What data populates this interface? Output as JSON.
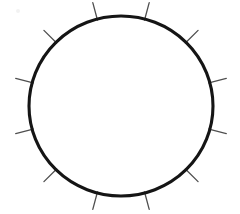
{
  "figure": {
    "background_color": "#ffffff",
    "width": 240,
    "height": 214
  },
  "circle": {
    "name": "main-circle",
    "center_x": 121,
    "center_y": 106,
    "radius_x": 92,
    "radius_y": 90,
    "stroke_color": "#151515",
    "stroke_width": 3.1,
    "fill": "none"
  },
  "ticks": {
    "count": 12,
    "stroke_color": "#4f4f4f",
    "stroke_width": 1.3,
    "length": 17,
    "spacing_degrees": 30,
    "angle_offset_degrees": 15,
    "angles_degrees": [
      15,
      45,
      75,
      105,
      135,
      165,
      195,
      225,
      255,
      285,
      315,
      345
    ],
    "items": [
      {
        "label": "tick-1",
        "angle": 345
      },
      {
        "label": "tick-2",
        "angle": 15
      },
      {
        "label": "tick-3",
        "angle": 45
      },
      {
        "label": "tick-4",
        "angle": 75
      },
      {
        "label": "tick-5",
        "angle": 105
      },
      {
        "label": "tick-6",
        "angle": 135
      },
      {
        "label": "tick-7",
        "angle": 165
      },
      {
        "label": "tick-8",
        "angle": 195
      },
      {
        "label": "tick-9",
        "angle": 225
      },
      {
        "label": "tick-10",
        "angle": 255
      },
      {
        "label": "tick-11",
        "angle": 285
      },
      {
        "label": "tick-12",
        "angle": 315
      }
    ]
  },
  "artifact": {
    "name": "scan-speck",
    "x": 16,
    "y": 9,
    "color": "#f2f2f2"
  }
}
